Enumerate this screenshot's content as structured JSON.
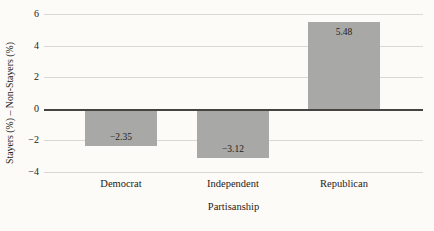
{
  "chart_data": {
    "type": "bar",
    "title": "",
    "categories": [
      "Democrat",
      "Independent",
      "Republican"
    ],
    "values": [
      -2.35,
      -3.12,
      5.48
    ],
    "bar_labels": [
      "−2.35",
      "−3.12",
      "5.48"
    ],
    "xlabel": "Partisanship",
    "ylabel": "Stayers (%) – Non-Stayers (%)",
    "ylim": [
      -4,
      6
    ],
    "yticks": [
      6,
      4,
      2,
      0,
      -2,
      -4
    ],
    "ytick_labels": [
      "6",
      "4",
      "2",
      "0",
      "−2",
      "−4"
    ],
    "grid": true,
    "legend": "none",
    "bar_label_position": "inside_end",
    "colors": {
      "bar_fill": "#a8a8a6",
      "gridline": "#d9d8d4",
      "zero_line": "#464440",
      "text": "#242220",
      "background": "#fcfbf8"
    }
  }
}
